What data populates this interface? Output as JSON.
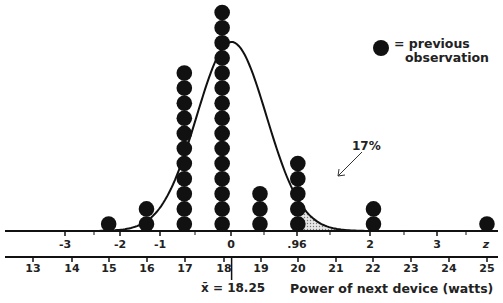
{
  "chart_data": {
    "type": "scatter",
    "subtype": "dot-plot-with-normal-curve",
    "title": "",
    "xlabel": "Power of next device (watts)",
    "secondary_axis_label": "z",
    "watt_ticks": [
      13,
      14,
      15,
      16,
      17,
      18,
      19,
      20,
      21,
      22,
      23,
      24,
      25
    ],
    "z_ticks": [
      "-3",
      "-2",
      "-1",
      "0",
      ".96",
      "2",
      "3",
      "z"
    ],
    "z_tick_watts": [
      13.6,
      15.4,
      17.1,
      18.25,
      20,
      21.95,
      23.8,
      25
    ],
    "dot_plot": {
      "x": [
        15,
        16,
        17,
        18,
        19,
        20,
        22,
        25
      ],
      "counts": [
        1,
        2,
        11,
        15,
        3,
        5,
        2,
        1
      ]
    },
    "mean": 18.25,
    "mean_label": "x̄ = 18.25",
    "shaded_region": {
      "from_z": 0.96,
      "to_z": "inf",
      "from_watts": 20,
      "percent": "17%"
    },
    "legend": [
      {
        "symbol": "filled-circle",
        "label": "= previous observation"
      }
    ],
    "grid": false
  },
  "labels": {
    "legend_line1": "= previous",
    "legend_line2": "observation",
    "percent": "17%",
    "mean": "x̄ = 18.25",
    "xlabel": "Power of next device (watts)"
  },
  "z_axis": [
    {
      "label": "-3",
      "x": 65
    },
    {
      "label": "-2",
      "x": 120
    },
    {
      "label": "-1",
      "x": 160
    },
    {
      "label": "0",
      "x": 231
    },
    {
      "label": ".96",
      "x": 297
    },
    {
      "label": "2",
      "x": 370
    },
    {
      "label": "3",
      "x": 437
    },
    {
      "label": "z",
      "x": 486
    }
  ],
  "w_axis": [
    {
      "label": "13",
      "x": 33
    },
    {
      "label": "14",
      "x": 72
    },
    {
      "label": "15",
      "x": 109
    },
    {
      "label": "16",
      "x": 147
    },
    {
      "label": "17",
      "x": 185
    },
    {
      "label": "18",
      "x": 224
    },
    {
      "label": "19",
      "x": 261
    },
    {
      "label": "20",
      "x": 298
    },
    {
      "label": "21",
      "x": 336
    },
    {
      "label": "22",
      "x": 373
    },
    {
      "label": "23",
      "x": 411
    },
    {
      "label": "24",
      "x": 449
    },
    {
      "label": "25",
      "x": 487
    }
  ]
}
